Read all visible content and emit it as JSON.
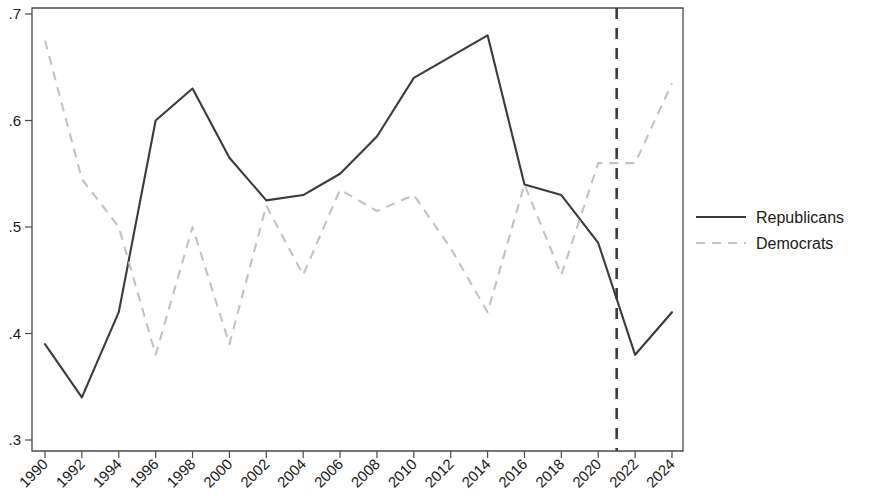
{
  "chart_data": {
    "type": "line",
    "title": "",
    "xlabel": "",
    "ylabel": "",
    "grid": false,
    "legend_position": "right",
    "x": [
      1990,
      1992,
      1994,
      1996,
      1998,
      2000,
      2002,
      2004,
      2006,
      2008,
      2010,
      2012,
      2014,
      2016,
      2018,
      2020,
      2022,
      2024
    ],
    "categories": [
      "1990",
      "1992",
      "1994",
      "1996",
      "1998",
      "2000",
      "2002",
      "2004",
      "2006",
      "2008",
      "2010",
      "2012",
      "2014",
      "2016",
      "2018",
      "2020",
      "2022",
      "2024"
    ],
    "xtick_labels": [
      "1990",
      "1992",
      "1994",
      "1996",
      "1998",
      "2000",
      "2002",
      "2004",
      "2006",
      "2008",
      "2010",
      "2012",
      "2014",
      "2016",
      "2018",
      "2020",
      "2022",
      "2024"
    ],
    "ytick_labels": [
      ".3",
      ".4",
      ".5",
      ".6",
      ".7"
    ],
    "ytick_values": [
      0.3,
      0.4,
      0.5,
      0.6,
      0.7
    ],
    "ylim": [
      0.3,
      0.7
    ],
    "xlim": [
      1990,
      2024
    ],
    "series": [
      {
        "name": "Republicans",
        "style": "solid",
        "color": "#3b3b3b",
        "values": [
          0.39,
          0.34,
          0.42,
          0.6,
          0.63,
          0.565,
          0.525,
          0.53,
          0.55,
          0.585,
          0.64,
          0.66,
          0.68,
          0.54,
          0.53,
          0.485,
          0.38,
          0.42
        ]
      },
      {
        "name": "Democrats",
        "style": "dashed",
        "color": "#c2c2c2",
        "values": [
          0.675,
          0.545,
          0.5,
          0.38,
          0.5,
          0.39,
          0.52,
          0.455,
          0.535,
          0.515,
          0.53,
          0.48,
          0.42,
          0.54,
          0.455,
          0.56,
          0.56,
          0.635
        ]
      }
    ],
    "annotations": [
      {
        "type": "vertical-line",
        "x": 2021,
        "style": "dashed",
        "color": "#3b3b3b"
      }
    ]
  },
  "legend": {
    "entries": [
      {
        "label": "Republicans",
        "style": "solid"
      },
      {
        "label": "Democrats",
        "style": "dashed"
      }
    ]
  }
}
